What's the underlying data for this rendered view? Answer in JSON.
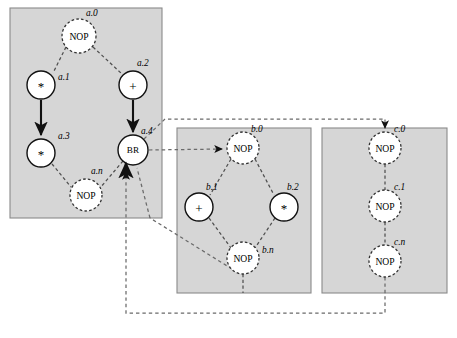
{
  "diagram": {
    "colors": {
      "block_fill": "#d6d6d6",
      "block_stroke": "#8a8a8a",
      "solid_edge": "#111111",
      "dashed_edge": "#4f4f4f",
      "node_fill": "#ffffff"
    },
    "blocks": [
      {
        "id": "block-a",
        "x": 10,
        "y": 8,
        "w": 152,
        "h": 210,
        "nodes": [
          {
            "id": "a0",
            "label": "NOP",
            "tag": "a.0",
            "cx": 79,
            "cy": 36,
            "r": 17,
            "style": "dashed",
            "tag_x": 86,
            "tag_y": 16,
            "kind": "nop"
          },
          {
            "id": "a1",
            "label": "*",
            "tag": "a.1",
            "cx": 41,
            "cy": 85,
            "r": 14,
            "style": "solid",
            "tag_x": 58,
            "tag_y": 80,
            "kind": "op"
          },
          {
            "id": "a2",
            "label": "+",
            "tag": "a.2",
            "cx": 133,
            "cy": 85,
            "r": 14,
            "style": "solid",
            "tag_x": 137,
            "tag_y": 66,
            "kind": "op"
          },
          {
            "id": "a3",
            "label": "*",
            "tag": "a.3",
            "cx": 41,
            "cy": 153,
            "r": 14,
            "style": "solid",
            "tag_x": 58,
            "tag_y": 139,
            "kind": "op"
          },
          {
            "id": "a4",
            "label": "BR",
            "tag": "a.4",
            "cx": 133,
            "cy": 150,
            "r": 15,
            "style": "solid",
            "tag_x": 141,
            "tag_y": 134,
            "kind": "br"
          },
          {
            "id": "an",
            "label": "NOP",
            "tag": "a.n",
            "cx": 86,
            "cy": 195,
            "r": 16,
            "style": "dashed",
            "tag_x": 91,
            "tag_y": 174,
            "kind": "nop"
          }
        ]
      },
      {
        "id": "block-b",
        "x": 177,
        "y": 128,
        "w": 134,
        "h": 165,
        "nodes": [
          {
            "id": "b0",
            "label": "NOP",
            "tag": "b.0",
            "cx": 243,
            "cy": 148,
            "r": 16,
            "style": "dashed",
            "tag_x": 251,
            "tag_y": 132,
            "kind": "nop"
          },
          {
            "id": "b1",
            "label": "+",
            "tag": "b.1",
            "cx": 199,
            "cy": 207,
            "r": 14,
            "style": "solid",
            "tag_x": 206,
            "tag_y": 190,
            "kind": "op"
          },
          {
            "id": "b2",
            "label": "*",
            "tag": "b.2",
            "cx": 284,
            "cy": 207,
            "r": 14,
            "style": "solid",
            "tag_x": 287,
            "tag_y": 190,
            "kind": "op"
          },
          {
            "id": "bn",
            "label": "NOP",
            "tag": "b.n",
            "cx": 243,
            "cy": 258,
            "r": 16,
            "style": "dashed",
            "tag_x": 252,
            "tag_y": 251,
            "kind": "nop"
          }
        ]
      },
      {
        "id": "block-c",
        "x": 322,
        "y": 128,
        "w": 125,
        "h": 165,
        "nodes": [
          {
            "id": "c0",
            "label": "NOP",
            "tag": "c.0",
            "cx": 385,
            "cy": 148,
            "r": 16,
            "style": "dashed",
            "tag_x": 394,
            "tag_y": 132,
            "kind": "nop"
          },
          {
            "id": "c1",
            "label": "NOP",
            "tag": "c.1",
            "cx": 385,
            "cy": 206,
            "r": 16,
            "style": "dashed",
            "tag_x": 394,
            "tag_y": 190,
            "kind": "nop"
          },
          {
            "id": "cn",
            "label": "NOP",
            "tag": "c.n",
            "cx": 385,
            "cy": 261,
            "r": 16,
            "style": "dashed",
            "tag_x": 394,
            "tag_y": 245,
            "kind": "nop"
          }
        ]
      }
    ],
    "edges": [
      {
        "id": "e-a0-a1",
        "from": "a.0",
        "to": "a.1",
        "style": "dashed"
      },
      {
        "id": "e-a0-a2",
        "from": "a.0",
        "to": "a.2",
        "style": "dashed"
      },
      {
        "id": "e-a1-a3",
        "from": "a.1",
        "to": "a.3",
        "style": "solid"
      },
      {
        "id": "e-a2-a4",
        "from": "a.2",
        "to": "a.4",
        "style": "solid"
      },
      {
        "id": "e-a3-an",
        "from": "a.3",
        "to": "a.n",
        "style": "dashed"
      },
      {
        "id": "e-a4-an",
        "from": "a.4",
        "to": "a.n",
        "style": "dashed"
      },
      {
        "id": "e-a4-b0",
        "from": "a.4",
        "to": "b.0",
        "style": "dashed"
      },
      {
        "id": "e-a4-c0",
        "from": "a.4",
        "to": "c.0",
        "style": "dashed"
      },
      {
        "id": "e-b0-b1",
        "from": "b.0",
        "to": "b.1",
        "style": "dashed"
      },
      {
        "id": "e-b0-b2",
        "from": "b.0",
        "to": "b.2",
        "style": "dashed"
      },
      {
        "id": "e-b1-bn",
        "from": "b.1",
        "to": "b.n",
        "style": "dashed"
      },
      {
        "id": "e-b2-bn",
        "from": "b.2",
        "to": "b.n",
        "style": "dashed"
      },
      {
        "id": "e-bn-a4",
        "from": "b.n",
        "to": "a.4",
        "style": "dashed"
      },
      {
        "id": "e-c0-c1",
        "from": "c.0",
        "to": "c.1",
        "style": "dashed"
      },
      {
        "id": "e-c1-cn",
        "from": "c.1",
        "to": "c.n",
        "style": "dashed"
      },
      {
        "id": "e-cn-a4",
        "from": "c.n",
        "to": "a.4",
        "style": "dashed"
      }
    ]
  }
}
